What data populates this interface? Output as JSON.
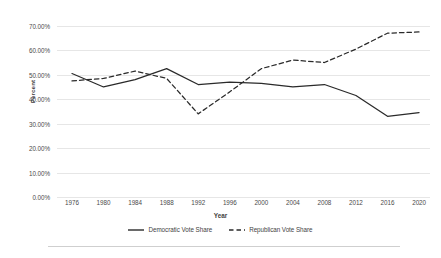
{
  "chart_data": {
    "type": "line",
    "title": "",
    "xlabel": "Year",
    "ylabel": "Percent",
    "categories": [
      "1976",
      "1980",
      "1984",
      "1988",
      "1992",
      "1996",
      "2000",
      "2004",
      "2008",
      "2012",
      "2016",
      "2020"
    ],
    "x": [
      1976,
      1980,
      1984,
      1988,
      1992,
      1996,
      2000,
      2004,
      2008,
      2012,
      2016,
      2020
    ],
    "series": [
      {
        "name": "Democratic Vote Share",
        "style": "solid",
        "color": "#2a2a2a",
        "values": [
          50.5,
          45.0,
          48.0,
          52.5,
          46.0,
          47.0,
          46.5,
          45.0,
          46.0,
          41.5,
          33.0,
          34.5
        ]
      },
      {
        "name": "Republican Vote Share",
        "style": "dashed",
        "color": "#2a2a2a",
        "values": [
          47.5,
          48.5,
          51.5,
          48.5,
          34.0,
          43.0,
          52.5,
          56.0,
          55.0,
          60.5,
          67.0,
          67.5
        ]
      }
    ],
    "ylim": [
      0,
      70
    ],
    "ytick_values": [
      0,
      10,
      20,
      30,
      40,
      50,
      60,
      70
    ],
    "ytick_labels": [
      "0.00%",
      "10.00%",
      "20.00%",
      "30.00%",
      "40.00%",
      "50.00%",
      "60.00%",
      "70.00%"
    ],
    "grid": true,
    "legend_position": "bottom",
    "gridline_color": "#e6e6e6"
  },
  "legend": {
    "items": [
      {
        "label": "Democratic Vote Share"
      },
      {
        "label": "Republican Vote Share"
      }
    ]
  }
}
